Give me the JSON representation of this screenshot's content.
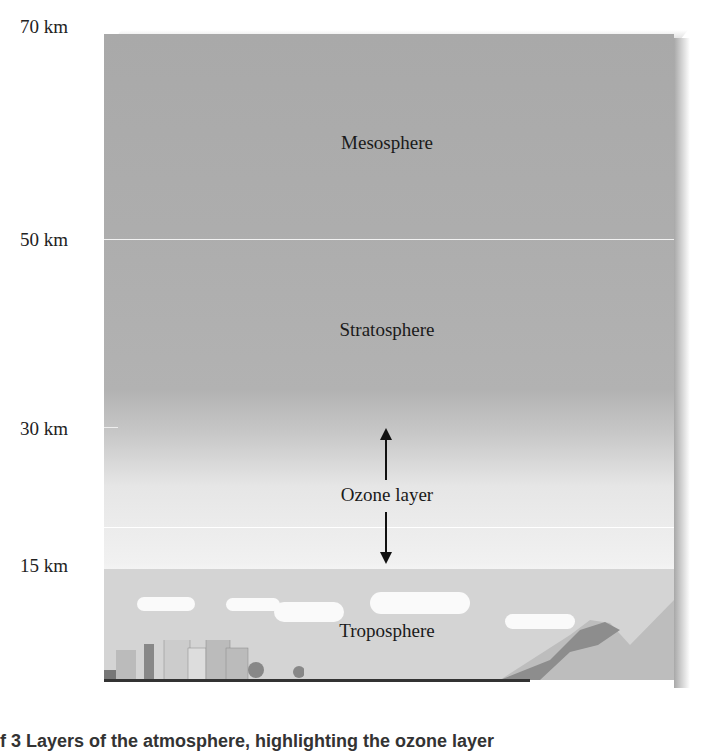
{
  "altitude_labels": [
    {
      "text": "70 km",
      "top": 16
    },
    {
      "text": "50 km",
      "top": 229
    },
    {
      "text": "30 km",
      "top": 418
    },
    {
      "text": "15 km",
      "top": 555
    }
  ],
  "layers": {
    "mesosphere": "Mesosphere",
    "stratosphere": "Stratosphere",
    "ozone": "Ozone layer",
    "troposphere": "Troposphere"
  },
  "caption": "f 3 Layers of the atmosphere, highlighting the ozone layer"
}
